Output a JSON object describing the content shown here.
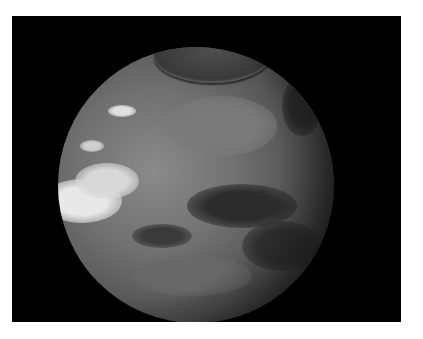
{
  "image": {
    "description": "Rendered grayscale planetary globe (Mars-like) against a black background with a dark polar cap at the top and bright white cloud/frost regions on the lower left",
    "colors": {
      "border": "#ffffff",
      "background": "#000000",
      "surface_light": "#8a8a8a",
      "surface_mid": "#707070",
      "surface_dark": "#3a3a3a",
      "polar_cap": "#444444",
      "highlight": "#f0f0f0"
    },
    "frame": {
      "x": 12,
      "y": 16,
      "width": 389,
      "height": 306
    },
    "globe": {
      "cx": 184,
      "cy": 169,
      "r": 138
    },
    "polar_cap": {
      "cx": 200,
      "cy": 40,
      "rx": 58,
      "ry": 27
    },
    "features": [
      {
        "type": "bright",
        "cx": 70,
        "cy": 185,
        "rx": 40,
        "ry": 22,
        "color": "#e8e8e8"
      },
      {
        "type": "bright",
        "cx": 95,
        "cy": 165,
        "rx": 32,
        "ry": 18,
        "color": "#d8d8d8"
      },
      {
        "type": "bright",
        "cx": 110,
        "cy": 95,
        "rx": 14,
        "ry": 6,
        "color": "#e0e0e0"
      },
      {
        "type": "bright",
        "cx": 80,
        "cy": 130,
        "rx": 12,
        "ry": 6,
        "color": "#cfcfcf"
      },
      {
        "type": "dark",
        "cx": 230,
        "cy": 190,
        "rx": 55,
        "ry": 22,
        "color": "#2c2c2c"
      },
      {
        "type": "dark",
        "cx": 270,
        "cy": 230,
        "rx": 40,
        "ry": 25,
        "color": "#303030"
      },
      {
        "type": "dark",
        "cx": 150,
        "cy": 220,
        "rx": 30,
        "ry": 12,
        "color": "#3a3a3a"
      },
      {
        "type": "dark",
        "cx": 290,
        "cy": 90,
        "rx": 20,
        "ry": 30,
        "color": "#2a2a2a"
      },
      {
        "type": "mid",
        "cx": 210,
        "cy": 110,
        "rx": 55,
        "ry": 30,
        "color": "#7a7a7a"
      },
      {
        "type": "mid",
        "cx": 180,
        "cy": 260,
        "rx": 60,
        "ry": 20,
        "color": "#686868"
      }
    ]
  }
}
